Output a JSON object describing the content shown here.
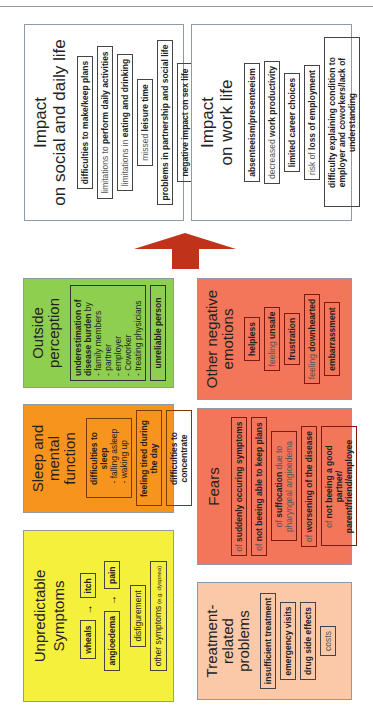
{
  "impact_social": {
    "title_line1": "Impact",
    "title_line2": "on social and daily life",
    "items": [
      {
        "bold": "difficulties to make/keep plans",
        "light_prefix": ""
      },
      {
        "light_prefix": "limitations to ",
        "bold": "perform daily activities"
      },
      {
        "light_prefix": "limitations in ",
        "bold": "eating and drinking"
      },
      {
        "light_prefix": "missed ",
        "bold": "leisure time"
      },
      {
        "light_prefix": "",
        "bold": "problems in partnership and social life"
      },
      {
        "light_prefix": "",
        "bold": "negative impact on sex life"
      }
    ]
  },
  "impact_work": {
    "title_line1": "Impact",
    "title_line2": "on work life",
    "items": [
      {
        "light_prefix": "",
        "bold": "absenteeism/presenteeism"
      },
      {
        "light_prefix": "decreased ",
        "bold": "work productivity"
      },
      {
        "light_prefix": "",
        "bold": "limited career choices"
      },
      {
        "light_prefix": "risk of ",
        "bold": "loss of employment"
      },
      {
        "light_prefix": "",
        "bold": "difficulty explaining condition to employer and coworkers/lack of understanding"
      }
    ]
  },
  "arrow": {
    "icon": "up-arrow-icon",
    "color": "#c0321a"
  },
  "outside_perception": {
    "title_line1": "Outside",
    "title_line2": "perception",
    "color": "#8fcf4f",
    "item1_bold": "underestimation of disease burden",
    "item1_tail": " by",
    "item1_list": [
      "family members",
      "partner",
      "employer",
      "Coworker",
      "treating physicians"
    ],
    "item2": "unreliable person"
  },
  "sleep": {
    "title_line1": "Sleep and mental",
    "title_line2": "function",
    "color": "#f7941d",
    "item1_bold": "difficulties to sleep",
    "item1_list": [
      "falling asleep",
      "waking up"
    ],
    "item2": "feeling tired during the day",
    "item3": "difficulties to concentrate"
  },
  "symptoms": {
    "title": "Unpredictable Symptoms",
    "color": "#f5f03c",
    "wheals": "wheals",
    "itch": "itch",
    "angioedema": "angioedema",
    "pain": "pain",
    "arrow_glyph": "→",
    "disfigurement": "disfigurement",
    "other": "other symptoms",
    "other_note": " (e.g. dyspnea)"
  },
  "emotions": {
    "title_line1": "Other negative",
    "title_line2": "emotions",
    "color": "#f4765a",
    "items": [
      {
        "light_prefix": "",
        "bold": "helpless"
      },
      {
        "light_prefix": "feeling ",
        "bold": "unsafe"
      },
      {
        "light_prefix": "",
        "bold": "frustration"
      },
      {
        "light_prefix": "feeling ",
        "bold": "downhearted"
      },
      {
        "light_prefix": "",
        "bold": "embarrassment"
      }
    ]
  },
  "fears": {
    "title": "Fears",
    "color": "#f4765a",
    "items": [
      {
        "light_prefix": "of ",
        "bold": "suddenly occuring symptoms"
      },
      {
        "light_prefix": "of ",
        "bold": "not beeing able to keep plans"
      },
      {
        "light_prefix": "of ",
        "bold": "suffocation",
        "light_suffix": " due to pharyngeal angioedema"
      },
      {
        "light_prefix": "of ",
        "bold": "worsening of the disease"
      },
      {
        "light_prefix": "of ",
        "bold": "not beeing a good partner/ parent/friend/employee"
      }
    ]
  },
  "treatment": {
    "title_line1": "Treatment-related",
    "title_line2": "problems",
    "color": "#fbc9a8",
    "items": [
      {
        "light_prefix": "",
        "bold": "insufficient treatment"
      },
      {
        "light_prefix": "",
        "bold": "emergency visits"
      },
      {
        "light_prefix": "",
        "bold": "drug side effects"
      },
      {
        "light_prefix": "costs",
        "bold": ""
      }
    ]
  }
}
